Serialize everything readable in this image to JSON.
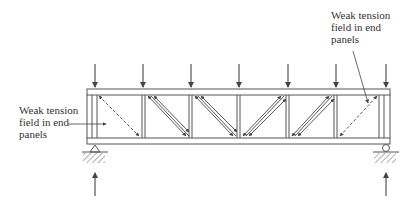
{
  "diagram": {
    "type": "plate girder tension field action",
    "colors": {
      "line": "#555555",
      "text": "#333333",
      "background": "#ffffff"
    },
    "labels": {
      "left": {
        "lines": [
          "Weak tension",
          "field in end",
          "panels"
        ]
      },
      "right": {
        "lines": [
          "Weak tension",
          "field in end",
          "panels"
        ]
      }
    },
    "loads": {
      "count": 7,
      "direction": "down",
      "x_positions": [
        95,
        143,
        191,
        239,
        288,
        336,
        386
      ]
    },
    "reactions": {
      "count": 2,
      "direction": "up",
      "x_positions": [
        95,
        386
      ]
    },
    "supports": [
      {
        "type": "pin",
        "x": 95
      },
      {
        "type": "roller",
        "x": 386
      }
    ],
    "panels": [
      {
        "index": 1,
        "tension_field": "weak",
        "diagonal": "down-right"
      },
      {
        "index": 2,
        "tension_field": "strong",
        "diagonal": "down-right"
      },
      {
        "index": 3,
        "tension_field": "strong",
        "diagonal": "down-right"
      },
      {
        "index": 4,
        "tension_field": "strong",
        "diagonal": "up-right"
      },
      {
        "index": 5,
        "tension_field": "strong",
        "diagonal": "up-right"
      },
      {
        "index": 6,
        "tension_field": "weak",
        "diagonal": "up-right"
      }
    ]
  }
}
